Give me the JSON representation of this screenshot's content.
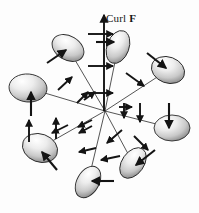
{
  "figure": {
    "background_color": "#fdfdfd",
    "ink_color": "#1a1a1a",
    "disc_fill_light": "#f4f4f4",
    "disc_fill_dark": "#8e8e8e",
    "width": 199,
    "height": 213
  },
  "axis": {
    "label_prefix": "Curl ",
    "label_vector": "F",
    "label_full": "Curl F",
    "x": 104,
    "y_top": 15,
    "y_bottom": 111
  },
  "hub": {
    "x": 105,
    "y": 111
  },
  "chart_data": {
    "type": "diagram",
    "title": "Curl F",
    "center": [
      105,
      111
    ],
    "curl_axis": {
      "from": [
        104,
        111
      ],
      "to": [
        104,
        15
      ],
      "label": "Curl F"
    },
    "spokes": [
      {
        "id": "spoke-up",
        "to": [
          118,
          47
        ]
      },
      {
        "id": "spoke-upper-left",
        "to": [
          68,
          48
        ]
      },
      {
        "id": "spoke-left",
        "to": [
          28,
          88
        ]
      },
      {
        "id": "spoke-lower-left",
        "to": [
          40,
          148
        ]
      },
      {
        "id": "spoke-bottom",
        "to": [
          88,
          182
        ]
      },
      {
        "id": "spoke-lower-right",
        "to": [
          133,
          163
        ]
      },
      {
        "id": "spoke-right",
        "to": [
          172,
          128
        ]
      },
      {
        "id": "spoke-upper-right",
        "to": [
          168,
          70
        ]
      }
    ],
    "discs": [
      {
        "id": "disc-top",
        "cx": 118,
        "cy": 47,
        "rx": 11,
        "ry": 17,
        "rotation": 20,
        "normal_from": [
          96,
          42
        ],
        "normal_to": [
          114,
          42
        ]
      },
      {
        "id": "disc-upper-left",
        "cx": 68,
        "cy": 48,
        "rx": 17,
        "ry": 12,
        "rotation": 30,
        "normal_from": [
          47,
          63
        ],
        "normal_to": [
          66,
          50
        ]
      },
      {
        "id": "disc-left",
        "cx": 28,
        "cy": 88,
        "rx": 19,
        "ry": 14,
        "rotation": 5,
        "normal_from": [
          31,
          116
        ],
        "normal_to": [
          31,
          92
        ]
      },
      {
        "id": "disc-lower-left",
        "cx": 40,
        "cy": 148,
        "rx": 18,
        "ry": 14,
        "rotation": 20,
        "normal_from": [
          57,
          170
        ],
        "normal_to": [
          42,
          152
        ]
      },
      {
        "id": "disc-bottom",
        "cx": 88,
        "cy": 182,
        "rx": 11,
        "ry": 17,
        "rotation": 30,
        "normal_from": [
          114,
          181
        ],
        "normal_to": [
          92,
          181
        ]
      },
      {
        "id": "disc-lower-right",
        "cx": 133,
        "cy": 163,
        "rx": 11,
        "ry": 17,
        "rotation": 35,
        "normal_from": [
          155,
          150
        ],
        "normal_to": [
          136,
          165
        ]
      },
      {
        "id": "disc-right",
        "cx": 172,
        "cy": 128,
        "rx": 18,
        "ry": 13,
        "rotation": 0,
        "normal_from": [
          169,
          103
        ],
        "normal_to": [
          169,
          128
        ]
      },
      {
        "id": "disc-upper-right",
        "cx": 168,
        "cy": 70,
        "rx": 17,
        "ry": 13,
        "rotation": 20,
        "normal_from": [
          147,
          53
        ],
        "normal_to": [
          166,
          68
        ]
      }
    ],
    "field_arrows": [
      {
        "id": "field-axis-cross-1",
        "from": [
          88,
          34
        ],
        "to": [
          113,
          34
        ]
      },
      {
        "id": "field-axis-cross-2",
        "from": [
          88,
          66
        ],
        "to": [
          113,
          66
        ]
      },
      {
        "id": "field-axis-cross-3",
        "from": [
          88,
          93
        ],
        "to": [
          113,
          93
        ]
      },
      {
        "id": "field-ne-1",
        "from": [
          126,
          73
        ],
        "to": [
          144,
          86
        ]
      },
      {
        "id": "field-ne-2",
        "from": [
          140,
          103
        ],
        "to": [
          140,
          122
        ]
      },
      {
        "id": "field-ne-3",
        "from": [
          124,
          103
        ],
        "to": [
          124,
          118
        ]
      },
      {
        "id": "field-e-inner",
        "from": [
          119,
          107
        ],
        "to": [
          132,
          107
        ]
      },
      {
        "id": "field-se-1",
        "from": [
          122,
          130
        ],
        "to": [
          107,
          143
        ]
      },
      {
        "id": "field-se-2",
        "from": [
          134,
          136
        ],
        "to": [
          148,
          150
        ]
      },
      {
        "id": "field-s-1",
        "from": [
          120,
          156
        ],
        "to": [
          101,
          160
        ]
      },
      {
        "id": "field-s-2",
        "from": [
          96,
          148
        ],
        "to": [
          79,
          152
        ]
      },
      {
        "id": "field-sw-1",
        "from": [
          92,
          126
        ],
        "to": [
          79,
          133
        ]
      },
      {
        "id": "field-w-inner",
        "from": [
          92,
          120
        ],
        "to": [
          78,
          127
        ]
      },
      {
        "id": "field-w-1",
        "from": [
          68,
          125
        ],
        "to": [
          52,
          133
        ]
      },
      {
        "id": "field-sw-up-1",
        "from": [
          56,
          139
        ],
        "to": [
          56,
          118
        ]
      },
      {
        "id": "field-sw-up-2",
        "from": [
          29,
          142
        ],
        "to": [
          29,
          120
        ]
      },
      {
        "id": "field-nw-1",
        "from": [
          58,
          90
        ],
        "to": [
          72,
          77
        ]
      },
      {
        "id": "field-nw-2",
        "from": [
          77,
          103
        ],
        "to": [
          88,
          92
        ]
      },
      {
        "id": "field-n-inner",
        "from": [
          84,
          100
        ],
        "to": [
          95,
          92
        ]
      }
    ]
  }
}
